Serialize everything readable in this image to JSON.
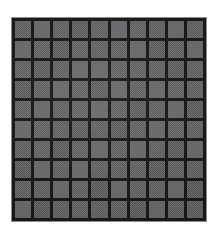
{
  "image": {
    "kind": "scanned-texture-photo",
    "subject": "dark square-tiled grid panel",
    "width_px": 220,
    "height_px": 236,
    "background_color": "#ffffff"
  },
  "panel": {
    "left_px": 11,
    "top_px": 17,
    "width_px": 196,
    "height_px": 205,
    "outline_color": "#8d8d8e",
    "outline_width_px": 1,
    "gap_color": "#161617",
    "gap_width_px": 3
  },
  "grid": {
    "columns": 10,
    "rows": 10,
    "cell_count": 100,
    "cell_base_color": "#5a5a5c",
    "cell_light_color": "#6e6e70",
    "cell_dark_color": "#3f3f41",
    "cell_tone_variants": [
      "t-mid",
      "t-lite",
      "t-dark"
    ],
    "texture": "2px checkerboard dither",
    "tones": [
      [
        "t-mid",
        "t-lite",
        "t-mid",
        "t-dark",
        "t-mid",
        "t-lite",
        "t-mid",
        "t-mid",
        "t-lite",
        "t-mid"
      ],
      [
        "t-lite",
        "t-mid",
        "t-dark",
        "t-mid",
        "t-mid",
        "t-mid",
        "t-lite",
        "t-dark",
        "t-mid",
        "t-lite"
      ],
      [
        "t-mid",
        "t-dark",
        "t-mid",
        "t-lite",
        "t-lite",
        "t-mid",
        "t-mid",
        "t-mid",
        "t-dark",
        "t-mid"
      ],
      [
        "t-dark",
        "t-mid",
        "t-lite",
        "t-mid",
        "t-dark",
        "t-lite",
        "t-mid",
        "t-lite",
        "t-mid",
        "t-mid"
      ],
      [
        "t-mid",
        "t-lite",
        "t-mid",
        "t-mid",
        "t-lite",
        "t-mid",
        "t-dark",
        "t-mid",
        "t-lite",
        "t-dark"
      ],
      [
        "t-lite",
        "t-mid",
        "t-mid",
        "t-dark",
        "t-mid",
        "t-dark",
        "t-mid",
        "t-lite",
        "t-mid",
        "t-mid"
      ],
      [
        "t-mid",
        "t-mid",
        "t-dark",
        "t-mid",
        "t-lite",
        "t-mid",
        "t-lite",
        "t-mid",
        "t-dark",
        "t-lite"
      ],
      [
        "t-dark",
        "t-lite",
        "t-mid",
        "t-lite",
        "t-mid",
        "t-mid",
        "t-mid",
        "t-dark",
        "t-mid",
        "t-mid"
      ],
      [
        "t-mid",
        "t-mid",
        "t-lite",
        "t-mid",
        "t-dark",
        "t-lite",
        "t-mid",
        "t-mid",
        "t-lite",
        "t-dark"
      ],
      [
        "t-lite",
        "t-dark",
        "t-mid",
        "t-mid",
        "t-mid",
        "t-mid",
        "t-dark",
        "t-lite",
        "t-mid",
        "t-mid"
      ]
    ]
  }
}
